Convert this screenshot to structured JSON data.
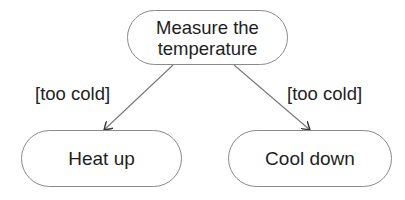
{
  "diagram": {
    "type": "activity-diagram",
    "nodes": [
      {
        "id": "measure",
        "label": "Measure the temperature",
        "line1": "Measure the",
        "line2": "temperature"
      },
      {
        "id": "heat",
        "label": "Heat up"
      },
      {
        "id": "cool",
        "label": "Cool down"
      }
    ],
    "edges": [
      {
        "from": "measure",
        "to": "heat",
        "guard": "[too cold]"
      },
      {
        "from": "measure",
        "to": "cool",
        "guard": "[too cold]"
      }
    ],
    "colors": {
      "border": "#8a8a8a",
      "arrow": "#777777",
      "text": "#1e1e1e"
    }
  }
}
